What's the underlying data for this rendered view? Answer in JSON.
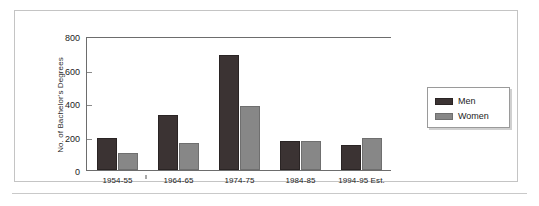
{
  "chart_data": {
    "type": "bar",
    "title": "",
    "subtitle": "",
    "xlabel": "",
    "ylabel": "No. of Bachelor's Degrees",
    "categories": [
      "1954-55",
      "1964-65",
      "1974-75",
      "1984-85",
      "1994-95 Est."
    ],
    "series": [
      {
        "name": "Men",
        "color": "#3b3333",
        "values": [
          191,
          328,
          685,
          173,
          148
        ]
      },
      {
        "name": "Women",
        "color": "#878787",
        "values": [
          100,
          162,
          382,
          172,
          191
        ]
      }
    ],
    "ylim": [
      0,
      800
    ],
    "yticks": [
      0,
      200,
      400,
      600,
      800
    ],
    "ytick_labels": [
      "0",
      "200",
      "400",
      "600",
      "800"
    ],
    "grid": false,
    "legend_position": "right",
    "annotations": []
  },
  "axis": {
    "y_title": "No. of Bachelor's Degrees",
    "ticks": [
      {
        "label": "800",
        "value": 800
      },
      {
        "label": "600",
        "value": 600
      },
      {
        "label": "400",
        "value": 400
      },
      {
        "label": "200",
        "value": 200
      },
      {
        "label": "0",
        "value": 0
      }
    ]
  },
  "legend": {
    "items": [
      {
        "label": "Men",
        "swatch": "men"
      },
      {
        "label": "Women",
        "swatch": "women"
      }
    ]
  },
  "colors": {
    "men": "#3b3333",
    "women": "#878787",
    "axis": "#6d6d6d",
    "frame": "#c4c4c4",
    "background": "#ffffff"
  }
}
